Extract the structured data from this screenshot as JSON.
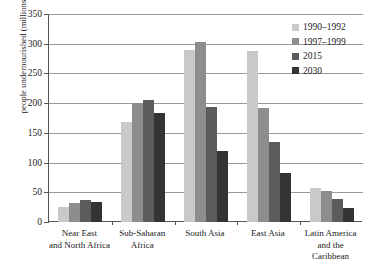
{
  "chart_data": {
    "type": "bar",
    "title": "",
    "xlabel": "",
    "ylabel": "people undernourished (millions)",
    "ylim": [
      0,
      350
    ],
    "ytick_labels": [
      "0",
      "50",
      "100",
      "150",
      "200",
      "250",
      "300",
      "350"
    ],
    "ytick_values": [
      0,
      50,
      100,
      150,
      200,
      250,
      300,
      350
    ],
    "grid": true,
    "legend_position": "top-right",
    "categories": [
      "Near East and North Africa",
      "Sub-Saharan Africa",
      "South Asia",
      "East Asia",
      "Latin America and the Caribbean"
    ],
    "category_lines": [
      [
        "Near East",
        "and North Africa"
      ],
      [
        "Sub-Saharan",
        "Africa"
      ],
      [
        "South Asia",
        ""
      ],
      [
        "East Asia",
        ""
      ],
      [
        "Latin America",
        "and the Caribbean"
      ]
    ],
    "series": [
      {
        "name": "1990–1992",
        "color": "#c9c9c9",
        "values": [
          25,
          168,
          290,
          287,
          58
        ]
      },
      {
        "name": "1997–1999",
        "color": "#8d8d8d",
        "values": [
          32,
          201,
          303,
          192,
          53
        ]
      },
      {
        "name": "2015",
        "color": "#5c5c5c",
        "values": [
          37,
          205,
          194,
          134,
          39
        ]
      },
      {
        "name": "2030",
        "color": "#343434",
        "values": [
          34,
          184,
          119,
          82,
          24
        ]
      }
    ]
  },
  "legend": {
    "items": [
      {
        "label": "1990–1992",
        "color": "#c9c9c9"
      },
      {
        "label": "1997–1999",
        "color": "#8d8d8d"
      },
      {
        "label": "2015",
        "color": "#5c5c5c"
      },
      {
        "label": "2030",
        "color": "#343434"
      }
    ]
  }
}
